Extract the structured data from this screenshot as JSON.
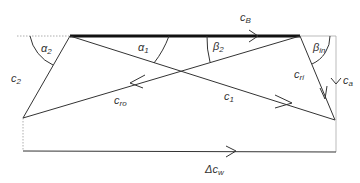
{
  "diagram": {
    "type": "velocity-triangles",
    "colors": {
      "line": "#333333",
      "blade": "#111111",
      "dotted": "#999999",
      "background": "#ffffff"
    },
    "labels": {
      "cB": {
        "main": "c",
        "sub": "B"
      },
      "alpha1": {
        "main": "α",
        "sub": "1"
      },
      "alpha2": {
        "main": "α",
        "sub": "2"
      },
      "beta2": {
        "main": "β",
        "sub": "2"
      },
      "beta_in": {
        "main": "β",
        "sub": "in"
      },
      "c2": {
        "main": "c",
        "sub": "2"
      },
      "c1": {
        "main": "c",
        "sub": "1"
      },
      "cro": {
        "main": "c",
        "sub": "ro"
      },
      "cri": {
        "main": "c",
        "sub": "ri"
      },
      "ca": {
        "main": "c",
        "sub": "a"
      },
      "delta_cw": {
        "main": "Δc",
        "sub": "w"
      }
    }
  }
}
